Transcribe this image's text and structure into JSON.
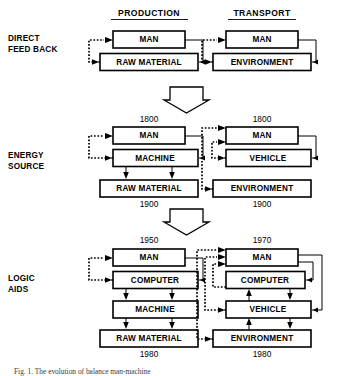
{
  "figure": {
    "title_columns": [
      "PRODUCTION",
      "TRANSPORT"
    ],
    "caption": "Fig. 1. The evolution of balance man-machine"
  },
  "columns": {
    "production": "PRODUCTION",
    "transport": "TRANSPORT"
  },
  "rows": [
    {
      "id": "direct-feed-back",
      "label_line1": "DIRECT",
      "label_line2": "FEED BACK",
      "left": {
        "boxes": [
          "MAN",
          "RAW MATERIAL"
        ],
        "year_top": "",
        "year_bottom": ""
      },
      "right": {
        "boxes": [
          "MAN",
          "ENVIRONMENT"
        ],
        "year_top": "",
        "year_bottom": ""
      }
    },
    {
      "id": "energy-source",
      "label_line1": "ENERGY",
      "label_line2": "SOURCE",
      "left": {
        "boxes": [
          "MAN",
          "MACHINE",
          "RAW MATERIAL"
        ],
        "year_top": "1800",
        "year_bottom": "1900"
      },
      "right": {
        "boxes": [
          "MAN",
          "VEHICLE",
          "ENVIRONMENT"
        ],
        "year_top": "1800",
        "year_bottom": "1900"
      }
    },
    {
      "id": "logic-aids",
      "label_line1": "LOGIC",
      "label_line2": "AIDS",
      "left": {
        "boxes": [
          "MAN",
          "COMPUTER",
          "MACHINE",
          "RAW MATERIAL"
        ],
        "year_top": "1950",
        "year_bottom": "1980"
      },
      "right": {
        "boxes": [
          "MAN",
          "COMPUTER",
          "VEHICLE",
          "ENVIRONMENT"
        ],
        "year_top": "1970",
        "year_bottom": "1980"
      }
    }
  ],
  "boxes": {
    "r1_left_man": "MAN",
    "r1_left_raw": "RAW MATERIAL",
    "r1_right_man": "MAN",
    "r1_right_env": "ENVIRONMENT",
    "r2_left_man": "MAN",
    "r2_left_machine": "MACHINE",
    "r2_left_raw": "RAW MATERIAL",
    "r2_right_man": "MAN",
    "r2_right_vehicle": "VEHICLE",
    "r2_right_env": "ENVIRONMENT",
    "r3_left_man": "MAN",
    "r3_left_computer": "COMPUTER",
    "r3_left_machine": "MACHINE",
    "r3_left_raw": "RAW MATERIAL",
    "r3_right_man": "MAN",
    "r3_right_computer": "COMPUTER",
    "r3_right_vehicle": "VEHICLE",
    "r3_right_env": "ENVIRONMENT"
  },
  "years": {
    "r2_left_top": "1800",
    "r2_right_top": "1800",
    "r2_left_bottom": "1900",
    "r2_right_bottom": "1900",
    "r3_left_top": "1950",
    "r3_right_top": "1970",
    "r3_left_bottom": "1980",
    "r3_right_bottom": "1980"
  },
  "row_labels": {
    "r1_line1": "DIRECT",
    "r1_line2": "FEED BACK",
    "r2_line1": "ENERGY",
    "r2_line2": "SOURCE",
    "r3_line1": "LOGIC",
    "r3_line2": "AIDS"
  },
  "caption": {
    "text": "Fig. 1. The evolution of balance man-machine"
  },
  "colors": {
    "ink": "#000000",
    "paper": "#ffffff",
    "caption_ink": "#3a3a3a"
  }
}
